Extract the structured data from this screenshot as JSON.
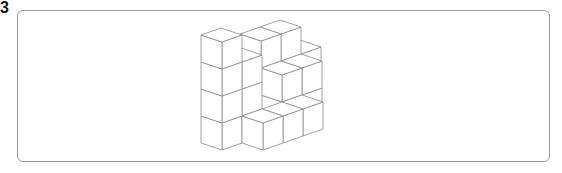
{
  "problem": {
    "number_label": "3"
  },
  "figure": {
    "stroke_color": "#8a8a8a",
    "fill_color": "#ffffff",
    "frame_border_color": "#9a9a9a",
    "projection": {
      "ox": 222,
      "oy": 150,
      "ix": 20,
      "iy": -7,
      "jx": -21,
      "jy": -7,
      "kz": -27
    },
    "voxels": [
      [
        0,
        0,
        0
      ],
      [
        0,
        0,
        1
      ],
      [
        0,
        0,
        2
      ],
      [
        0,
        0,
        3
      ],
      [
        1,
        0,
        0
      ],
      [
        1,
        0,
        1
      ],
      [
        1,
        0,
        2
      ],
      [
        2,
        1,
        0
      ],
      [
        2,
        1,
        1
      ],
      [
        3,
        1,
        0
      ],
      [
        3,
        1,
        1
      ],
      [
        3,
        1,
        2
      ],
      [
        4,
        1,
        0
      ],
      [
        4,
        1,
        1
      ],
      [
        4,
        1,
        2
      ],
      [
        3,
        0,
        0
      ],
      [
        3,
        0,
        1
      ],
      [
        4,
        0,
        0
      ],
      [
        4,
        0,
        1
      ],
      [
        5,
        1,
        0
      ],
      [
        5,
        1,
        1
      ],
      [
        1,
        -1,
        0
      ],
      [
        2,
        -1,
        0
      ],
      [
        3,
        -1,
        0
      ]
    ]
  }
}
